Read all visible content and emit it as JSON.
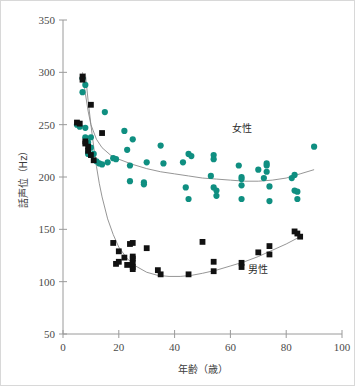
{
  "figure": {
    "background_color": "#ffffff",
    "border_color": "#d8d8d8"
  },
  "chart_data": {
    "type": "scatter",
    "title": "",
    "subtitle": "",
    "xlabel": "年齢（歳）",
    "ylabel": "話声位（Hz）",
    "xlim": [
      0,
      100
    ],
    "ylim": [
      50,
      350
    ],
    "xticks": [
      0,
      20,
      40,
      60,
      80,
      100
    ],
    "yticks": [
      50,
      100,
      150,
      200,
      250,
      300,
      350
    ],
    "xtick_labels": [
      "0",
      "20",
      "40",
      "60",
      "80",
      "100"
    ],
    "ytick_labels": [
      "50",
      "100",
      "150",
      "200",
      "250",
      "300",
      "350"
    ],
    "grid": false,
    "legend_position": "inline-annotation",
    "annotations": [
      {
        "text": "女性",
        "x": 64,
        "y": 243,
        "series": "female"
      },
      {
        "text": "男性",
        "x": 70,
        "y": 108,
        "series": "male"
      }
    ],
    "series": [
      {
        "name": "女性",
        "marker": "circle",
        "color": "#0f8f81",
        "points": [
          [
            5,
            250
          ],
          [
            6,
            248
          ],
          [
            7,
            294
          ],
          [
            7,
            281
          ],
          [
            8,
            288
          ],
          [
            8,
            247
          ],
          [
            8,
            238
          ],
          [
            9,
            233
          ],
          [
            9,
            224
          ],
          [
            9,
            222
          ],
          [
            10,
            238
          ],
          [
            10,
            228
          ],
          [
            10,
            221
          ],
          [
            11,
            222
          ],
          [
            12,
            215
          ],
          [
            13,
            213
          ],
          [
            14,
            212
          ],
          [
            15,
            262
          ],
          [
            16,
            214
          ],
          [
            18,
            218
          ],
          [
            19,
            217
          ],
          [
            22,
            244
          ],
          [
            23,
            226
          ],
          [
            24,
            211
          ],
          [
            24,
            196
          ],
          [
            25,
            236
          ],
          [
            29,
            195
          ],
          [
            29,
            193
          ],
          [
            30,
            214
          ],
          [
            35,
            230
          ],
          [
            36,
            213
          ],
          [
            43,
            214
          ],
          [
            44,
            190
          ],
          [
            45,
            222
          ],
          [
            45,
            179
          ],
          [
            46,
            220
          ],
          [
            53,
            201
          ],
          [
            54,
            221
          ],
          [
            54,
            217
          ],
          [
            54,
            190
          ],
          [
            55,
            187
          ],
          [
            55,
            182
          ],
          [
            63,
            211
          ],
          [
            64,
            200
          ],
          [
            64,
            198
          ],
          [
            64,
            192
          ],
          [
            64,
            179
          ],
          [
            70,
            207
          ],
          [
            72,
            199
          ],
          [
            73,
            213
          ],
          [
            73,
            211
          ],
          [
            73,
            205
          ],
          [
            74,
            191
          ],
          [
            74,
            177
          ],
          [
            82,
            199
          ],
          [
            83,
            202
          ],
          [
            83,
            187
          ],
          [
            84,
            186
          ],
          [
            84,
            179
          ],
          [
            90,
            229
          ]
        ]
      },
      {
        "name": "男性",
        "marker": "square",
        "color": "#111111",
        "points": [
          [
            5,
            252
          ],
          [
            6,
            251
          ],
          [
            7,
            296
          ],
          [
            7,
            293
          ],
          [
            8,
            234
          ],
          [
            8,
            232
          ],
          [
            9,
            229
          ],
          [
            9,
            225
          ],
          [
            10,
            269
          ],
          [
            10,
            221
          ],
          [
            11,
            216
          ],
          [
            14,
            242
          ],
          [
            18,
            137
          ],
          [
            19,
            117
          ],
          [
            20,
            129
          ],
          [
            20,
            119
          ],
          [
            22,
            123
          ],
          [
            23,
            116
          ],
          [
            24,
            136
          ],
          [
            25,
            137
          ],
          [
            25,
            124
          ],
          [
            25,
            122
          ],
          [
            25,
            118
          ],
          [
            25,
            114
          ],
          [
            25,
            112
          ],
          [
            30,
            132
          ],
          [
            34,
            111
          ],
          [
            35,
            107
          ],
          [
            45,
            107
          ],
          [
            50,
            138
          ],
          [
            54,
            119
          ],
          [
            54,
            110
          ],
          [
            64,
            118
          ],
          [
            64,
            114
          ],
          [
            70,
            128
          ],
          [
            74,
            134
          ],
          [
            74,
            126
          ],
          [
            83,
            148
          ],
          [
            84,
            146
          ],
          [
            85,
            143
          ]
        ]
      }
    ],
    "fit_curves": [
      {
        "name": "female-fit",
        "color": "#8a8a8a",
        "points": [
          [
            7,
            300
          ],
          [
            8,
            280
          ],
          [
            9,
            263
          ],
          [
            10,
            250
          ],
          [
            12,
            236
          ],
          [
            14,
            228
          ],
          [
            17,
            221
          ],
          [
            20,
            217
          ],
          [
            25,
            212
          ],
          [
            30,
            208
          ],
          [
            35,
            205
          ],
          [
            40,
            203
          ],
          [
            45,
            201
          ],
          [
            50,
            199
          ],
          [
            55,
            198
          ],
          [
            60,
            197
          ],
          [
            65,
            196
          ],
          [
            70,
            196
          ],
          [
            75,
            197
          ],
          [
            80,
            199
          ],
          [
            85,
            203
          ],
          [
            90,
            207
          ]
        ]
      },
      {
        "name": "male-fit",
        "color": "#8a8a8a",
        "points": [
          [
            8,
            299
          ],
          [
            9,
            273
          ],
          [
            10,
            250
          ],
          [
            11,
            229
          ],
          [
            12,
            210
          ],
          [
            13,
            194
          ],
          [
            14,
            181
          ],
          [
            16,
            160
          ],
          [
            18,
            145
          ],
          [
            20,
            133
          ],
          [
            23,
            122
          ],
          [
            26,
            115
          ],
          [
            30,
            109
          ],
          [
            34,
            106
          ],
          [
            38,
            105
          ],
          [
            42,
            105
          ],
          [
            46,
            106
          ],
          [
            50,
            108
          ],
          [
            55,
            111
          ],
          [
            60,
            115
          ],
          [
            65,
            119
          ],
          [
            70,
            124
          ],
          [
            75,
            130
          ],
          [
            80,
            136
          ],
          [
            85,
            143
          ]
        ]
      }
    ]
  }
}
